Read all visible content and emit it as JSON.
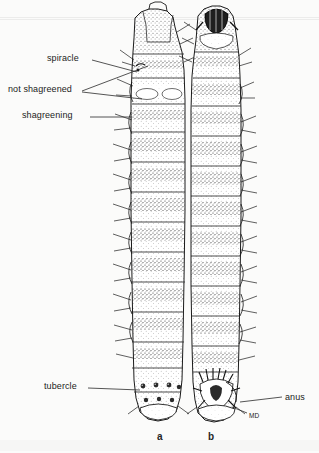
{
  "figure": {
    "background_color": "#fbfbfa",
    "ink_color": "#1b1b1b",
    "specimens": [
      {
        "id": "a",
        "caption": "a",
        "aspect": "dorsal",
        "x": 157,
        "y": 437
      },
      {
        "id": "b",
        "caption": "b",
        "aspect": "ventral",
        "x": 208,
        "y": 437
      }
    ]
  },
  "annotations": [
    {
      "name": "spiracle",
      "text": "spiracle",
      "text_x": 47,
      "text_y": 59,
      "leader": {
        "x1": 92,
        "y1": 60,
        "x2": 137,
        "y2": 72
      }
    },
    {
      "name": "not-shagreened",
      "text": "not shagreened",
      "text_x": 8,
      "text_y": 90,
      "leader": {
        "x1": 82,
        "y1": 91,
        "x2": 148,
        "y2": 66
      },
      "leader2": {
        "x1": 82,
        "y1": 92,
        "x2": 142,
        "y2": 99
      }
    },
    {
      "name": "shagreening",
      "text": "shagreening",
      "text_x": 22,
      "text_y": 116,
      "leader": {
        "x1": 90,
        "y1": 117,
        "x2": 132,
        "y2": 117
      }
    },
    {
      "name": "tubercle",
      "text": "tubercle",
      "text_x": 44,
      "text_y": 387,
      "leader": {
        "x1": 88,
        "y1": 388,
        "x2": 140,
        "y2": 390
      }
    },
    {
      "name": "anus",
      "text": "anus",
      "text_x": 285,
      "text_y": 398,
      "leader": {
        "x1": 282,
        "y1": 397,
        "x2": 240,
        "y2": 402
      }
    },
    {
      "name": "md",
      "text": "MD",
      "text_x": 249,
      "text_y": 416,
      "leader": {
        "x1": 247,
        "y1": 413,
        "x2": 232,
        "y2": 407
      }
    }
  ]
}
